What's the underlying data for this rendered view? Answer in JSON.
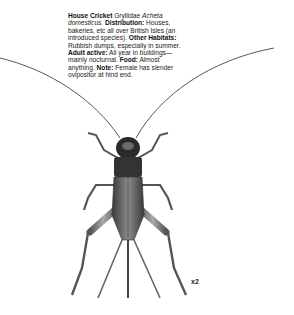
{
  "entry": {
    "name": "House Cricket",
    "family": "Gryllidae",
    "genus": "Acheta",
    "species": "domesticus.",
    "distribution_label": "Distribution:",
    "distribution": "Houses, bakeries, etc all over British Isles (an introduced species).",
    "other_habitats_label": "Other Habitats:",
    "other_habitats": "Rubbish dumps, especially in summer.",
    "adult_active_label": "Adult active:",
    "adult_active": "All year in buildings—mainly nocturnal.",
    "food_label": "Food:",
    "food": "Almost anything.",
    "note_label": "Note:",
    "note": "Female has slender ovipositor at hind end."
  },
  "illustration": {
    "subject": "house-cricket-female",
    "scale_label": "x2"
  }
}
